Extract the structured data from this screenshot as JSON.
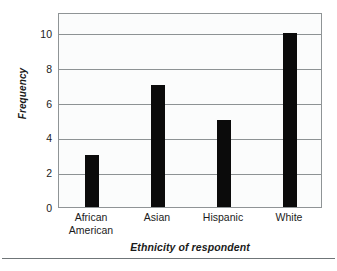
{
  "chart_data": {
    "type": "bar",
    "title": "",
    "xlabel": "Ethnicity of respondent",
    "ylabel": "Frequency",
    "categories": [
      "African American",
      "Asian",
      "Hispanic",
      "White"
    ],
    "category_lines": [
      [
        "African",
        "American"
      ],
      [
        "Asian"
      ],
      [
        "Hispanic"
      ],
      [
        "White"
      ]
    ],
    "values": [
      3,
      7,
      5,
      10
    ],
    "ylim": [
      0,
      11.2
    ],
    "yticks": [
      0,
      2,
      4,
      6,
      8,
      10
    ],
    "ytick_labels": [
      "0",
      "2",
      "4",
      "6",
      "8",
      "10"
    ],
    "grid": "horizontal",
    "legend": "none",
    "bar_color": "#0b0b0b",
    "plot_background": "#fbfcfc",
    "gridline_color": "#8d9294",
    "frame_color": "#8f9496"
  }
}
